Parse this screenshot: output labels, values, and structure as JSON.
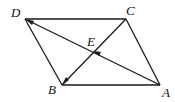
{
  "diagram": {
    "type": "parallelogram-vectors",
    "points": {
      "A": {
        "label": "A",
        "x": 160,
        "y": 85
      },
      "B": {
        "label": "B",
        "x": 62,
        "y": 85
      },
      "C": {
        "label": "C",
        "x": 126,
        "y": 19
      },
      "D": {
        "label": "D",
        "x": 25,
        "y": 19
      },
      "E": {
        "label": "E",
        "x": 94,
        "y": 51
      }
    },
    "segments": [
      {
        "from": "D",
        "to": "C"
      },
      {
        "from": "B",
        "to": "A"
      },
      {
        "from": "D",
        "to": "B"
      },
      {
        "from": "C",
        "to": "A"
      },
      {
        "from": "A",
        "to": "D",
        "arrow_at": [
          "E",
          "D"
        ]
      },
      {
        "from": "C",
        "to": "B",
        "arrow_at": [
          "B"
        ]
      }
    ],
    "stroke_color": "#1a1a1a"
  }
}
